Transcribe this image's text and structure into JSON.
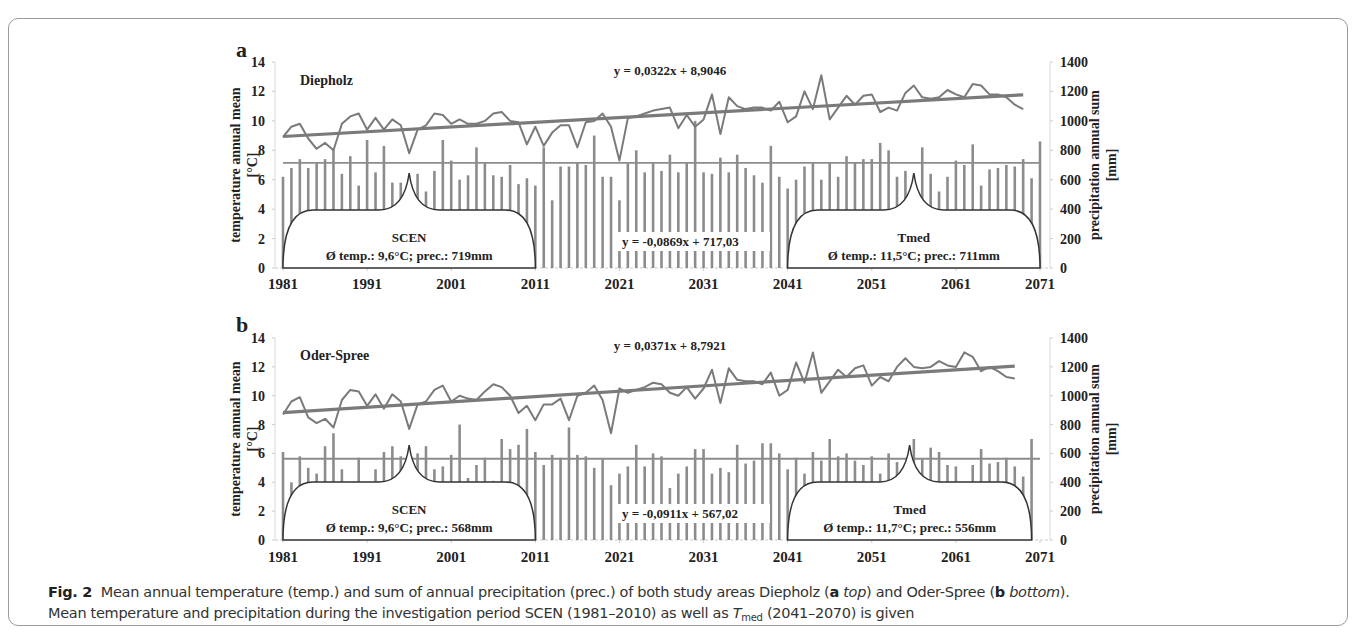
{
  "figure": {
    "caption_label": "Fig. 2",
    "caption_line1_a": "Mean annual temperature (temp.) and sum of annual precipitation (prec.) of both study areas Diepholz (",
    "caption_line1_b_bold": "a",
    "caption_line1_c_italic": "top",
    "caption_line1_d": ") and Oder-Spree (",
    "caption_line1_e_bold": "b",
    "caption_line1_f_italic": "bottom",
    "caption_line1_g": ").",
    "caption_line2_a": "Mean temperature and precipitation during the investigation period SCEN (1981–2010) as well as ",
    "caption_line2_T": "T",
    "caption_line2_sub": "med",
    "caption_line2_b": " (2041–2070) is given"
  },
  "chart_data": [
    {
      "type": "bar+line",
      "panel_label": "a",
      "title": "Diepholz",
      "xlabel": "",
      "ylabel_left": "temperature annual mean [°C]",
      "ylabel_right": "precipitation annual sum [mm]",
      "ylim_left": [
        0,
        14
      ],
      "ylim_right": [
        0,
        1400
      ],
      "yticks_left": [
        "0",
        "2",
        "4",
        "6",
        "8",
        "10",
        "12",
        "14"
      ],
      "yticks_right": [
        "0",
        "200",
        "400",
        "600",
        "800",
        "1000",
        "1200",
        "1400"
      ],
      "xticks": [
        "1981",
        "1991",
        "2001",
        "2011",
        "2021",
        "2031",
        "2041",
        "2051",
        "2061",
        "2071"
      ],
      "x_start": 1981,
      "temp_trend_label": "y = 0,0322x + 8,9046",
      "prec_trend_label": "y = -0,0869x + 717,03",
      "temp_trend": {
        "slope": 0.0322,
        "intercept": 8.9046
      },
      "prec_trend": {
        "slope": -0.0869,
        "intercept": 717.03
      },
      "series": [
        {
          "name": "temperature",
          "type": "line",
          "values": [
            8.9,
            9.6,
            9.8,
            8.8,
            8.1,
            8.5,
            8.0,
            9.8,
            10.3,
            10.5,
            9.4,
            10.2,
            9.4,
            10.1,
            9.7,
            7.8,
            9.4,
            9.7,
            10.5,
            10.4,
            9.8,
            10.1,
            9.8,
            9.8,
            10.0,
            10.5,
            10.6,
            10.0,
            9.9,
            8.4,
            9.6,
            8.3,
            9.2,
            9.7,
            9.7,
            8.2,
            9.9,
            10.0,
            10.5,
            9.6,
            7.3,
            10.2,
            10.3,
            10.5,
            10.7,
            10.8,
            10.9,
            9.5,
            10.4,
            9.6,
            10.1,
            11.8,
            9.1,
            11.6,
            11.0,
            10.8,
            10.9,
            10.9,
            10.7,
            11.3,
            9.9,
            10.3,
            12.0,
            10.8,
            13.1,
            10.1,
            10.9,
            11.7,
            11.1,
            11.7,
            11.8,
            10.6,
            10.9,
            10.7,
            11.9,
            12.4,
            11.6,
            11.5,
            11.6,
            12.1,
            11.8,
            11.6,
            12.5,
            12.4,
            11.8,
            11.8,
            11.6,
            11.1,
            10.8
          ]
        },
        {
          "name": "precipitation",
          "type": "bar",
          "values": [
            620,
            680,
            740,
            680,
            720,
            740,
            800,
            640,
            760,
            560,
            870,
            650,
            830,
            580,
            580,
            600,
            640,
            520,
            660,
            870,
            730,
            600,
            630,
            820,
            720,
            630,
            620,
            700,
            570,
            610,
            560,
            820,
            460,
            690,
            690,
            720,
            700,
            900,
            620,
            620,
            460,
            710,
            800,
            650,
            720,
            660,
            770,
            650,
            720,
            1000,
            650,
            640,
            750,
            650,
            770,
            680,
            630,
            580,
            830,
            620,
            540,
            600,
            690,
            720,
            600,
            720,
            620,
            760,
            720,
            740,
            740,
            850,
            800,
            620,
            660,
            560,
            820,
            640,
            520,
            620,
            730,
            700,
            840,
            560,
            670,
            680,
            700,
            690,
            740,
            610,
            860
          ]
        },
        {
          "name": "precipitation mean",
          "type": "hline",
          "value": 715
        }
      ],
      "annotations": [
        {
          "label": "SCEN",
          "detail": "Ø temp.: 9,6°C; prec.: 719mm",
          "x_range": [
            1981,
            2011
          ]
        },
        {
          "label": "Tmed",
          "detail": "Ø temp.: 11,5°C; prec.: 711mm",
          "x_range": [
            2041,
            2071
          ]
        }
      ]
    },
    {
      "type": "bar+line",
      "panel_label": "b",
      "title": "Oder-Spree",
      "xlabel": "",
      "ylabel_left": "temperature annual mean [°C]",
      "ylabel_right": "precipitation annual sum [mm]",
      "ylim_left": [
        0,
        14
      ],
      "ylim_right": [
        0,
        1400
      ],
      "yticks_left": [
        "0",
        "2",
        "4",
        "6",
        "8",
        "10",
        "12",
        "14"
      ],
      "yticks_right": [
        "0",
        "200",
        "400",
        "600",
        "800",
        "1000",
        "1200",
        "1400"
      ],
      "xticks": [
        "1981",
        "1991",
        "2001",
        "2011",
        "2021",
        "2031",
        "2041",
        "2051",
        "2061",
        "2071"
      ],
      "x_start": 1981,
      "temp_trend_label": "y = 0,0371x + 8,7921",
      "prec_trend_label": "y = -0,0911x + 567,02",
      "temp_trend": {
        "slope": 0.0371,
        "intercept": 8.7921
      },
      "prec_trend": {
        "slope": -0.0911,
        "intercept": 567.02
      },
      "series": [
        {
          "name": "temperature",
          "type": "line",
          "values": [
            8.7,
            9.6,
            9.9,
            8.5,
            8.1,
            8.4,
            7.8,
            9.7,
            10.4,
            10.3,
            9.3,
            10.1,
            9.1,
            10.1,
            9.6,
            7.7,
            9.4,
            9.6,
            10.4,
            10.7,
            9.6,
            10.0,
            9.8,
            9.7,
            10.3,
            10.8,
            10.6,
            10.0,
            8.8,
            9.3,
            8.3,
            9.4,
            9.4,
            9.8,
            8.3,
            10.0,
            10.2,
            10.7,
            9.7,
            7.4,
            10.5,
            10.2,
            10.4,
            10.6,
            10.9,
            10.8,
            10.2,
            10.0,
            10.6,
            9.8,
            10.5,
            11.8,
            9.5,
            11.9,
            11.1,
            11.0,
            11.0,
            10.8,
            11.6,
            10.0,
            10.4,
            12.3,
            10.9,
            13.0,
            10.2,
            11.0,
            11.8,
            11.3,
            11.9,
            12.1,
            10.7,
            11.3,
            11.0,
            12.0,
            12.6,
            12.0,
            11.9,
            12.0,
            12.4,
            12.1,
            12.0,
            13.0,
            12.7,
            11.7,
            12.0,
            11.7,
            11.3,
            11.2
          ]
        },
        {
          "name": "precipitation",
          "type": "bar",
          "values": [
            610,
            400,
            580,
            500,
            460,
            650,
            740,
            490,
            390,
            570,
            390,
            490,
            610,
            650,
            580,
            460,
            600,
            650,
            490,
            510,
            590,
            800,
            430,
            520,
            570,
            410,
            700,
            630,
            660,
            770,
            610,
            520,
            590,
            570,
            780,
            590,
            580,
            500,
            560,
            380,
            460,
            510,
            660,
            510,
            600,
            580,
            360,
            460,
            510,
            630,
            630,
            460,
            500,
            470,
            660,
            530,
            550,
            670,
            670,
            600,
            490,
            570,
            460,
            610,
            550,
            700,
            580,
            600,
            550,
            520,
            580,
            460,
            600,
            540,
            520,
            700,
            560,
            640,
            610,
            520,
            510,
            360,
            520,
            630,
            530,
            540,
            570,
            510,
            440,
            700
          ]
        },
        {
          "name": "precipitation mean",
          "type": "hline",
          "value": 563
        }
      ],
      "annotations": [
        {
          "label": "SCEN",
          "detail": "Ø temp.: 9,6°C; prec.: 568mm",
          "x_range": [
            1981,
            2011
          ]
        },
        {
          "label": "Tmed",
          "detail": "Ø temp.: 11,7°C; prec.: 556mm",
          "x_range": [
            2041,
            2070
          ]
        }
      ]
    }
  ]
}
